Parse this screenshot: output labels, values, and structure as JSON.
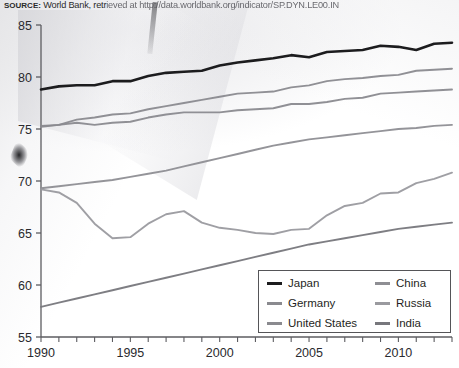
{
  "source": {
    "label": "SOURCE:",
    "text": "World Bank, retrieved at http://data.worldbank.org/indicator/SP.DYN.LE00.IN",
    "prefix": "World Bank, retr",
    "url_faded": "ieved at http://data.worldbank.org/indicator/SP.DYN.LE00.IN"
  },
  "legend": {
    "entries": [
      {
        "label": "Japan",
        "color": "#1c1c1e"
      },
      {
        "label": "China",
        "color": "#8e8e93"
      },
      {
        "label": "Germany",
        "color": "#8a8a8f"
      },
      {
        "label": "Russia",
        "color": "#9a9a9f"
      },
      {
        "label": "United States",
        "color": "#8a8a8f"
      },
      {
        "label": "India",
        "color": "#77777c"
      }
    ]
  },
  "chart_data": {
    "type": "line",
    "title": "",
    "subtitle": "",
    "xlabel": "",
    "ylabel": "",
    "xlim": [
      1990,
      2013
    ],
    "ylim": [
      55,
      85
    ],
    "xticks": [
      1990,
      1995,
      2000,
      2005,
      2010
    ],
    "yticks": [
      55,
      60,
      65,
      70,
      75,
      80,
      85
    ],
    "xtick_labels": [
      "1990",
      "1995",
      "2000",
      "2005",
      "2010"
    ],
    "ytick_labels": [
      "55",
      "60",
      "65",
      "70",
      "75",
      "80",
      "85"
    ],
    "minor_xticks_every": 1,
    "grid": false,
    "legend_position": "bottom-right",
    "x": [
      1990,
      1991,
      1992,
      1993,
      1994,
      1995,
      1996,
      1997,
      1998,
      1999,
      2000,
      2001,
      2002,
      2003,
      2004,
      2005,
      2006,
      2007,
      2008,
      2009,
      2010,
      2011,
      2012,
      2013
    ],
    "series": [
      {
        "name": "Japan",
        "color": "#1c1c1e",
        "values": [
          78.8,
          79.1,
          79.2,
          79.2,
          79.6,
          79.6,
          80.1,
          80.4,
          80.5,
          80.6,
          81.1,
          81.4,
          81.6,
          81.8,
          82.1,
          81.9,
          82.4,
          82.5,
          82.6,
          83.0,
          82.9,
          82.6,
          83.2,
          83.3
        ]
      },
      {
        "name": "Germany",
        "color": "#8a8a8f",
        "values": [
          75.3,
          75.4,
          75.9,
          76.1,
          76.4,
          76.5,
          76.9,
          77.2,
          77.5,
          77.8,
          78.1,
          78.4,
          78.5,
          78.6,
          79.0,
          79.2,
          79.6,
          79.8,
          79.9,
          80.1,
          80.2,
          80.6,
          80.7,
          80.8
        ]
      },
      {
        "name": "United States",
        "color": "#8a8a8f",
        "values": [
          75.2,
          75.4,
          75.6,
          75.4,
          75.6,
          75.7,
          76.1,
          76.4,
          76.6,
          76.6,
          76.6,
          76.8,
          76.9,
          77.0,
          77.4,
          77.4,
          77.6,
          77.9,
          78.0,
          78.4,
          78.5,
          78.6,
          78.7,
          78.8
        ]
      },
      {
        "name": "China",
        "color": "#8e8e93",
        "values": [
          69.3,
          69.5,
          69.7,
          69.9,
          70.1,
          70.4,
          70.7,
          71.0,
          71.4,
          71.8,
          72.2,
          72.6,
          73.0,
          73.4,
          73.7,
          74.0,
          74.2,
          74.4,
          74.6,
          74.8,
          75.0,
          75.1,
          75.3,
          75.4
        ]
      },
      {
        "name": "Russia",
        "color": "#9a9a9f",
        "values": [
          69.2,
          68.9,
          67.9,
          65.9,
          64.5,
          64.6,
          65.9,
          66.8,
          67.1,
          66.0,
          65.5,
          65.3,
          65.0,
          64.9,
          65.3,
          65.4,
          66.7,
          67.6,
          67.9,
          68.8,
          68.9,
          69.8,
          70.2,
          70.8
        ]
      },
      {
        "name": "India",
        "color": "#77777c",
        "values": [
          57.9,
          58.3,
          58.7,
          59.1,
          59.5,
          59.9,
          60.3,
          60.7,
          61.1,
          61.5,
          61.9,
          62.3,
          62.7,
          63.1,
          63.5,
          63.9,
          64.2,
          64.5,
          64.8,
          65.1,
          65.4,
          65.6,
          65.8,
          66.0
        ]
      }
    ]
  }
}
